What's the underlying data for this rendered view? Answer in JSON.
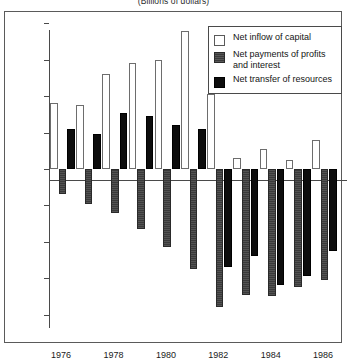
{
  "subtitle": "(Billions of dollars)",
  "legend": {
    "entries": [
      {
        "label": "Net inflow of capital",
        "key": "inflow",
        "color": "#ffffff"
      },
      {
        "label": "Net payments of profits and interest",
        "key": "payments",
        "color": "#3a3a3a"
      },
      {
        "label": "Net transfer of resources",
        "key": "transfer",
        "color": "#0d0d0d"
      }
    ]
  },
  "axes": {
    "y_ticks": [
      40,
      30,
      20,
      10,
      0,
      -10,
      -20,
      -30,
      -40
    ],
    "y_tick_labels": [
      "40",
      "30",
      "20",
      "10",
      "0",
      "-10",
      "-20",
      "-30",
      "-40"
    ],
    "x_tick_labels": [
      "1976",
      "1978",
      "1980",
      "1982",
      "1984",
      "1986"
    ]
  },
  "chart_data": {
    "type": "bar",
    "title": "",
    "subtitle": "(Billions of dollars)",
    "xlabel": "",
    "ylabel": "",
    "ylim": [
      -40,
      40
    ],
    "ytick_step": 10,
    "grid": false,
    "legend_position": "top-right",
    "categories": [
      "1976",
      "1977",
      "1978",
      "1979",
      "1980",
      "1981",
      "1982",
      "1983",
      "1984",
      "1985",
      "1986"
    ],
    "labeled_categories": [
      "1976",
      "1978",
      "1980",
      "1982",
      "1984",
      "1986"
    ],
    "series": [
      {
        "name": "Net inflow of capital",
        "values": [
          18,
          17.5,
          26,
          29,
          30,
          38,
          20.5,
          3,
          5.5,
          2.5,
          8
        ]
      },
      {
        "name": "Net payments of profits and interest",
        "values": [
          -7,
          -9.5,
          -12,
          -16.5,
          -21.5,
          -27.5,
          -38,
          -34.5,
          -35,
          -32.5,
          -30.5
        ]
      },
      {
        "name": "Net transfer of resources",
        "values": [
          11,
          9.5,
          15.5,
          14.5,
          12,
          11,
          -27,
          -24,
          -32,
          -29.5,
          -22.5
        ]
      }
    ]
  }
}
